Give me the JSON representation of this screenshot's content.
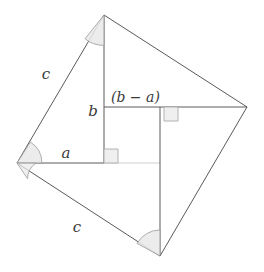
{
  "figure": {
    "background_color": "#ffffff",
    "stroke_color": "#5a5a5a",
    "faint_stroke_color": "#c8c8c8",
    "arc_fill_color": "#e8e8e8",
    "arc_stroke_color": "#9a9a9a",
    "right_angle_fill_color": "#efefef",
    "right_angle_stroke_color": "#a8a8a8",
    "label_color": "#3a3a3a"
  },
  "vertices": {
    "top": {
      "x": 104,
      "y": 15
    },
    "right": {
      "x": 247,
      "y": 107
    },
    "bottom": {
      "x": 160,
      "y": 256
    },
    "left": {
      "x": 17,
      "y": 163
    }
  },
  "inner_square": {
    "top_left": {
      "x": 104,
      "y": 107
    },
    "top_right": {
      "x": 160,
      "y": 107
    },
    "bottom_right": {
      "x": 160,
      "y": 163
    },
    "bottom_left": {
      "x": 104,
      "y": 163
    }
  },
  "labels": [
    {
      "id": "c-upper-left",
      "text": "c",
      "x": 46,
      "y": 79
    },
    {
      "id": "c-lower-left",
      "text": "c",
      "x": 77,
      "y": 232
    },
    {
      "id": "b-side",
      "text": "b",
      "x": 93,
      "y": 116
    },
    {
      "id": "a-side",
      "text": "a",
      "x": 66,
      "y": 158
    },
    {
      "id": "b-minus-a",
      "text": "(b − a)",
      "x": 111,
      "y": 102
    }
  ],
  "angle_marks": [
    {
      "id": "angle-top-vertex",
      "at": "top"
    },
    {
      "id": "angle-left-vertex-upper",
      "at": "left"
    },
    {
      "id": "angle-left-vertex-lower",
      "at": "left"
    },
    {
      "id": "angle-bottom-vertex",
      "at": "bottom"
    }
  ],
  "right_angle_marks": [
    {
      "id": "right-angle-inner-top-right",
      "x": 160,
      "y": 107
    },
    {
      "id": "right-angle-inner-bottom-left",
      "x": 104,
      "y": 163
    }
  ]
}
